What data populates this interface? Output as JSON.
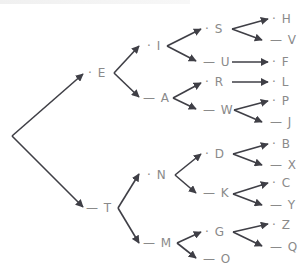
{
  "diagram": {
    "colors": {
      "edge": "#3f3f46",
      "label": "#8a8a8a",
      "background": "#ffffff"
    },
    "root": {
      "x": 12,
      "y": 136
    },
    "nodes": [
      {
        "id": "E",
        "letter": "E",
        "code": "·",
        "x": 88,
        "y": 73,
        "parent": "root"
      },
      {
        "id": "T",
        "letter": "T",
        "code": "—",
        "x": 86,
        "y": 208,
        "parent": "root"
      },
      {
        "id": "I",
        "letter": "I",
        "code": "·",
        "x": 147,
        "y": 46,
        "parent": "E"
      },
      {
        "id": "A",
        "letter": "A",
        "code": "—",
        "x": 143,
        "y": 98,
        "parent": "E"
      },
      {
        "id": "N",
        "letter": "N",
        "code": "·",
        "x": 147,
        "y": 175,
        "parent": "T"
      },
      {
        "id": "M",
        "letter": "M",
        "code": "—",
        "x": 143,
        "y": 243,
        "parent": "T"
      },
      {
        "id": "S",
        "letter": "S",
        "code": "·",
        "x": 205,
        "y": 29,
        "parent": "I"
      },
      {
        "id": "U",
        "letter": "U",
        "code": "—",
        "x": 203,
        "y": 62,
        "parent": "I"
      },
      {
        "id": "R",
        "letter": "R",
        "code": "·",
        "x": 205,
        "y": 82,
        "parent": "A"
      },
      {
        "id": "W",
        "letter": "W",
        "code": "—",
        "x": 203,
        "y": 110,
        "parent": "A"
      },
      {
        "id": "D",
        "letter": "D",
        "code": "·",
        "x": 205,
        "y": 154,
        "parent": "N"
      },
      {
        "id": "K",
        "letter": "K",
        "code": "—",
        "x": 203,
        "y": 193,
        "parent": "N"
      },
      {
        "id": "G",
        "letter": "G",
        "code": "·",
        "x": 205,
        "y": 232,
        "parent": "M"
      },
      {
        "id": "O",
        "letter": "O",
        "code": "—",
        "x": 203,
        "y": 259,
        "parent": "M"
      },
      {
        "id": "H",
        "letter": "H",
        "code": "·",
        "x": 272,
        "y": 19,
        "parent": "S"
      },
      {
        "id": "V",
        "letter": "V",
        "code": "—",
        "x": 270,
        "y": 40,
        "parent": "S"
      },
      {
        "id": "F",
        "letter": "F",
        "code": "·",
        "x": 272,
        "y": 62,
        "parent": "U"
      },
      {
        "id": "L",
        "letter": "L",
        "code": "·",
        "x": 272,
        "y": 82,
        "parent": "R"
      },
      {
        "id": "P",
        "letter": "P",
        "code": "·",
        "x": 272,
        "y": 101,
        "parent": "W"
      },
      {
        "id": "J",
        "letter": "J",
        "code": "—",
        "x": 270,
        "y": 122,
        "parent": "W"
      },
      {
        "id": "B",
        "letter": "B",
        "code": "·",
        "x": 272,
        "y": 144,
        "parent": "D"
      },
      {
        "id": "X",
        "letter": "X",
        "code": "—",
        "x": 270,
        "y": 165,
        "parent": "D"
      },
      {
        "id": "C",
        "letter": "C",
        "code": "·",
        "x": 272,
        "y": 183,
        "parent": "K"
      },
      {
        "id": "Y",
        "letter": "Y",
        "code": "—",
        "x": 270,
        "y": 205,
        "parent": "K"
      },
      {
        "id": "Z",
        "letter": "Z",
        "code": "·",
        "x": 272,
        "y": 225,
        "parent": "G"
      },
      {
        "id": "Q",
        "letter": "Q",
        "code": "—",
        "x": 270,
        "y": 247,
        "parent": "G"
      }
    ],
    "edges": [
      {
        "from": "root",
        "to": "E",
        "x1": 12,
        "y1": 136,
        "x2": 83,
        "y2": 74
      },
      {
        "from": "root",
        "to": "T",
        "x1": 12,
        "y1": 136,
        "x2": 83,
        "y2": 207
      },
      {
        "from": "E",
        "to": "I",
        "x1": 114,
        "y1": 73,
        "x2": 139,
        "y2": 46
      },
      {
        "from": "E",
        "to": "A",
        "x1": 114,
        "y1": 73,
        "x2": 139,
        "y2": 97
      },
      {
        "from": "I",
        "to": "S",
        "x1": 167,
        "y1": 46,
        "x2": 201,
        "y2": 29
      },
      {
        "from": "I",
        "to": "U",
        "x1": 167,
        "y1": 46,
        "x2": 196,
        "y2": 61
      },
      {
        "from": "A",
        "to": "R",
        "x1": 173,
        "y1": 98,
        "x2": 201,
        "y2": 83
      },
      {
        "from": "A",
        "to": "W",
        "x1": 173,
        "y1": 98,
        "x2": 196,
        "y2": 109
      },
      {
        "from": "S",
        "to": "H",
        "x1": 232,
        "y1": 29,
        "x2": 268,
        "y2": 19
      },
      {
        "from": "S",
        "to": "V",
        "x1": 232,
        "y1": 29,
        "x2": 262,
        "y2": 40
      },
      {
        "from": "U",
        "to": "F",
        "x1": 232,
        "y1": 62,
        "x2": 268,
        "y2": 62
      },
      {
        "from": "R",
        "to": "L",
        "x1": 232,
        "y1": 82,
        "x2": 268,
        "y2": 82
      },
      {
        "from": "W",
        "to": "P",
        "x1": 234,
        "y1": 110,
        "x2": 268,
        "y2": 101
      },
      {
        "from": "W",
        "to": "J",
        "x1": 234,
        "y1": 110,
        "x2": 262,
        "y2": 122
      },
      {
        "from": "T",
        "to": "N",
        "x1": 118,
        "y1": 208,
        "x2": 139,
        "y2": 174
      },
      {
        "from": "T",
        "to": "M",
        "x1": 118,
        "y1": 208,
        "x2": 139,
        "y2": 243
      },
      {
        "from": "N",
        "to": "D",
        "x1": 175,
        "y1": 175,
        "x2": 201,
        "y2": 154
      },
      {
        "from": "N",
        "to": "K",
        "x1": 175,
        "y1": 175,
        "x2": 196,
        "y2": 193
      },
      {
        "from": "M",
        "to": "G",
        "x1": 177,
        "y1": 243,
        "x2": 201,
        "y2": 232
      },
      {
        "from": "M",
        "to": "O",
        "x1": 177,
        "y1": 243,
        "x2": 196,
        "y2": 258
      },
      {
        "from": "D",
        "to": "B",
        "x1": 233,
        "y1": 154,
        "x2": 268,
        "y2": 144
      },
      {
        "from": "D",
        "to": "X",
        "x1": 233,
        "y1": 154,
        "x2": 262,
        "y2": 165
      },
      {
        "from": "K",
        "to": "C",
        "x1": 233,
        "y1": 194,
        "x2": 268,
        "y2": 183
      },
      {
        "from": "K",
        "to": "Y",
        "x1": 233,
        "y1": 194,
        "x2": 262,
        "y2": 205
      },
      {
        "from": "G",
        "to": "Z",
        "x1": 233,
        "y1": 232,
        "x2": 268,
        "y2": 224
      },
      {
        "from": "G",
        "to": "Q",
        "x1": 233,
        "y1": 232,
        "x2": 262,
        "y2": 246
      }
    ]
  }
}
